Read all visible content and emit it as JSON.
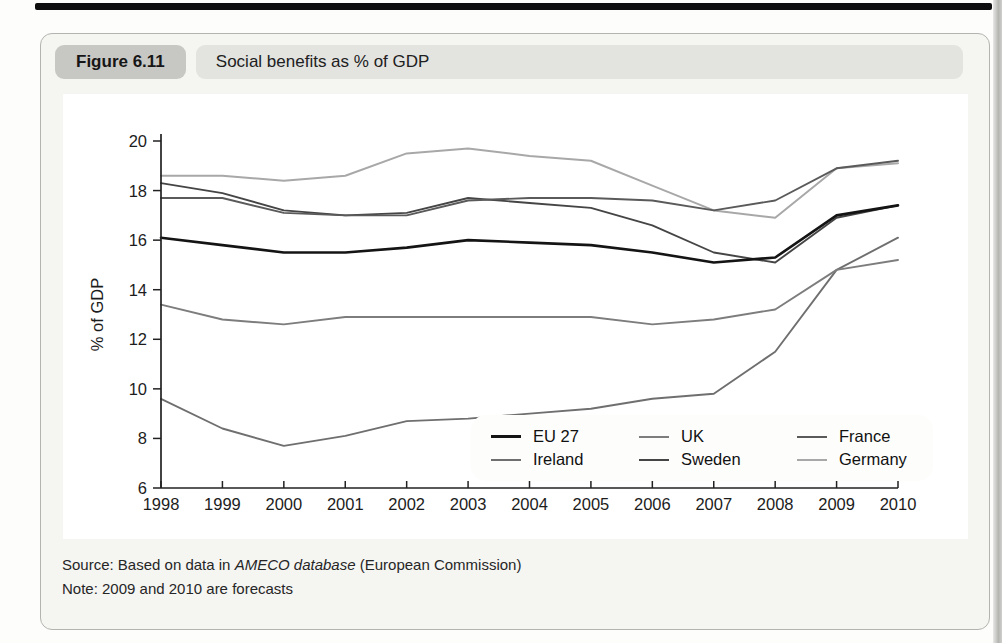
{
  "figure": {
    "label": "Figure 6.11",
    "title": "Social benefits as % of GDP"
  },
  "source": {
    "prefix": "Source: Based on data in ",
    "italic": "AMECO database",
    "suffix": " (European Commission)",
    "note": "Note: 2009 and 2010 are forecasts"
  },
  "chart_data": {
    "type": "line",
    "x": [
      1998,
      1999,
      2000,
      2001,
      2002,
      2003,
      2004,
      2005,
      2006,
      2007,
      2008,
      2009,
      2010
    ],
    "series": [
      {
        "name": "EU 27",
        "color": "#141414",
        "width": 2.6,
        "values": [
          16.1,
          15.8,
          15.5,
          15.5,
          15.7,
          16.0,
          15.9,
          15.8,
          15.5,
          15.1,
          15.3,
          17.0,
          17.4
        ]
      },
      {
        "name": "UK",
        "color": "#7d7d7d",
        "width": 1.9,
        "values": [
          13.4,
          12.8,
          12.6,
          12.9,
          12.9,
          12.9,
          12.9,
          12.9,
          12.6,
          12.8,
          13.2,
          14.8,
          15.2
        ]
      },
      {
        "name": "France",
        "color": "#5a5a5a",
        "width": 1.9,
        "values": [
          17.7,
          17.7,
          17.1,
          17.0,
          17.0,
          17.6,
          17.7,
          17.7,
          17.6,
          17.2,
          17.6,
          18.9,
          19.2
        ]
      },
      {
        "name": "Ireland",
        "color": "#6f6f6f",
        "width": 1.9,
        "values": [
          9.6,
          8.4,
          7.7,
          8.1,
          8.7,
          8.8,
          9.0,
          9.2,
          9.6,
          9.8,
          11.5,
          14.8,
          16.1
        ]
      },
      {
        "name": "Sweden",
        "color": "#454545",
        "width": 1.9,
        "values": [
          18.3,
          17.9,
          17.2,
          17.0,
          17.1,
          17.7,
          17.5,
          17.3,
          16.6,
          15.5,
          15.1,
          16.9,
          17.4
        ]
      },
      {
        "name": "Germany",
        "color": "#a8a8a8",
        "width": 2.0,
        "values": [
          18.6,
          18.6,
          18.4,
          18.6,
          19.5,
          19.7,
          19.4,
          19.2,
          18.2,
          17.2,
          16.9,
          18.9,
          19.1
        ]
      }
    ],
    "ylabel": "% of GDP",
    "ylim": [
      6,
      20
    ],
    "ytick_step": 2,
    "grid": false,
    "legend_position": "inside-lower-right",
    "legend_rows": [
      [
        "EU 27",
        "UK",
        "France"
      ],
      [
        "Ireland",
        "Sweden",
        "Germany"
      ]
    ],
    "axis_color": "#222222"
  }
}
